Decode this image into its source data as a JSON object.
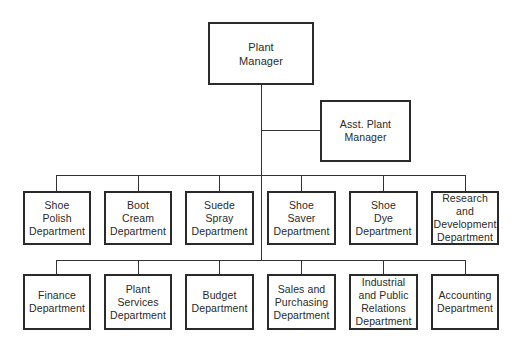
{
  "chart": {
    "top": {
      "label": "Plant\nManager"
    },
    "assistant": {
      "label": "Asst. Plant\nManager"
    },
    "row1": [
      {
        "label": "Shoe\nPolish\nDepartment"
      },
      {
        "label": "Boot\nCream\nDepartment"
      },
      {
        "label": "Suede\nSpray\nDepartment"
      },
      {
        "label": "Shoe\nSaver\nDepartment"
      },
      {
        "label": "Shoe\nDye\nDepartment"
      },
      {
        "label": "Research and\nDevelopment\nDepartment"
      }
    ],
    "row2": [
      {
        "label": "Finance\nDepartment"
      },
      {
        "label": "Plant\nServices\nDepartment"
      },
      {
        "label": "Budget\nDepartment"
      },
      {
        "label": "Sales and\nPurchasing\nDepartment"
      },
      {
        "label": "Industrial\nand Public\nRelations\nDepartment"
      },
      {
        "label": "Accounting\nDepartment"
      }
    ]
  }
}
